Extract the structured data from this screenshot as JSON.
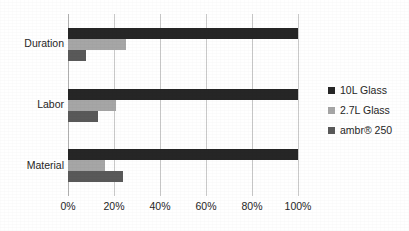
{
  "chart_data": {
    "type": "bar",
    "orientation": "horizontal",
    "title": "",
    "subtitle": "",
    "xlabel": "",
    "ylabel": "",
    "categories": [
      "Duration",
      "Labor",
      "Material"
    ],
    "series": [
      {
        "name": "10L Glass",
        "color": "#262626",
        "values": [
          100,
          100,
          100
        ]
      },
      {
        "name": "2.7L Glass",
        "color": "#a6a6a6",
        "values": [
          25,
          21,
          16
        ]
      },
      {
        "name": "ambr® 250",
        "color": "#595959",
        "values": [
          8,
          13,
          24
        ]
      }
    ],
    "xlim": [
      0,
      100
    ],
    "xticks": [
      0,
      20,
      40,
      60,
      80,
      100
    ],
    "xtick_labels": [
      "0%",
      "20%",
      "40%",
      "60%",
      "80%",
      "100%"
    ],
    "grid": "vertical",
    "legend_position": "right",
    "value_suffix": "%"
  },
  "legend": {
    "items": [
      {
        "label": "10L Glass",
        "swatch_name": "legend-swatch-10l-glass"
      },
      {
        "label": "2.7L Glass",
        "swatch_name": "legend-swatch-27l-glass"
      },
      {
        "label": "ambr® 250",
        "swatch_name": "legend-swatch-ambr-250"
      }
    ]
  }
}
